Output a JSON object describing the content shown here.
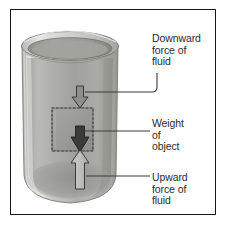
{
  "figure": {
    "type": "physics-diagram",
    "border_color": "#151515",
    "background_color": "#ffffff"
  },
  "labels": {
    "downward": "Downward\nforce of\nfluid",
    "weight": "Weight\nof\nobject",
    "upward": "Upward\nforce of\nfluid"
  },
  "illustration": {
    "beaker": {
      "name": "glass-beaker",
      "fluid_fill_color": "#a8a9a6",
      "glass_color": "#c9c9c5",
      "rim_color": "#d8d8d4",
      "outline_color": "#6f6f6c"
    },
    "object": {
      "name": "submerged-cube",
      "fill_color": "#9b9c99",
      "edge_style": "dashed",
      "edge_color": "#4a4a48"
    },
    "arrows": [
      {
        "name": "downward-force-arrow",
        "direction": "down",
        "style": "outlined-light",
        "fill": "#8e8f8c",
        "stroke": "#3c3c3a"
      },
      {
        "name": "weight-arrow",
        "direction": "down",
        "style": "filled-dark",
        "fill": "#3b3b39",
        "stroke": "#222220"
      },
      {
        "name": "upward-force-arrow",
        "direction": "up",
        "style": "outlined-light",
        "fill": "#bdbdb9",
        "stroke": "#3c3c3a"
      }
    ],
    "leader_lines": {
      "color": "#3a3a38",
      "count": 3
    }
  }
}
